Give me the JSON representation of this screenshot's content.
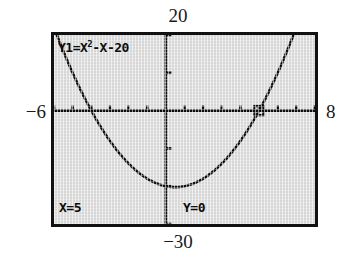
{
  "device": "graphing-calculator",
  "window": {
    "xmin_label": "−6",
    "xmax_label": "8",
    "ymax_label": "20",
    "ymin_label": "−30"
  },
  "screen": {
    "equation": {
      "prefix": "Y1=X",
      "exponent": "2",
      "suffix": "-X-20"
    },
    "trace": {
      "x_readout": "X=5",
      "y_readout": "Y=0"
    }
  },
  "colors": {
    "screen_background": "#d6d6d6",
    "ink": "#0d0d0d",
    "border": "#111111",
    "page": "#ffffff"
  },
  "chart_data": {
    "type": "line",
    "title": "",
    "xlabel": "",
    "ylabel": "",
    "function": "y = x^2 - x - 20",
    "xlim": [
      -6,
      8
    ],
    "ylim": [
      -30,
      20
    ],
    "grid": false,
    "legend": null,
    "axes": {
      "x_axis_at_y": 0,
      "y_axis_at_x": 0,
      "x_tick_spacing": 1,
      "y_tick_spacing": 10
    },
    "annotations": [
      {
        "label": "Y1=X²-X-20",
        "position": "top-left"
      },
      {
        "label": "X=5",
        "position": "bottom-left"
      },
      {
        "label": "Y=0",
        "position": "bottom-center"
      }
    ],
    "cursor": {
      "x": 5,
      "y": 0
    },
    "roots": [
      -4,
      5
    ],
    "vertex": {
      "x": 0.5,
      "y": -20.25
    },
    "y_intercept": -20,
    "x": [
      -6,
      -5.5,
      -5,
      -4.5,
      -4,
      -3.5,
      -3,
      -2.5,
      -2,
      -1.5,
      -1,
      -0.5,
      0,
      0.5,
      1,
      1.5,
      2,
      2.5,
      3,
      3.5,
      4,
      4.5,
      5,
      5.5,
      6,
      6.5,
      7,
      7.5,
      8
    ],
    "y": [
      22,
      15.75,
      10,
      4.75,
      0,
      -4.25,
      -8,
      -11.25,
      -14,
      -16.25,
      -18,
      -19.25,
      -20,
      -20.25,
      -20,
      -19.25,
      -18,
      -16.25,
      -14,
      -11.25,
      -8,
      -4.25,
      0,
      4.75,
      10,
      15.75,
      22,
      28.75,
      36
    ]
  }
}
